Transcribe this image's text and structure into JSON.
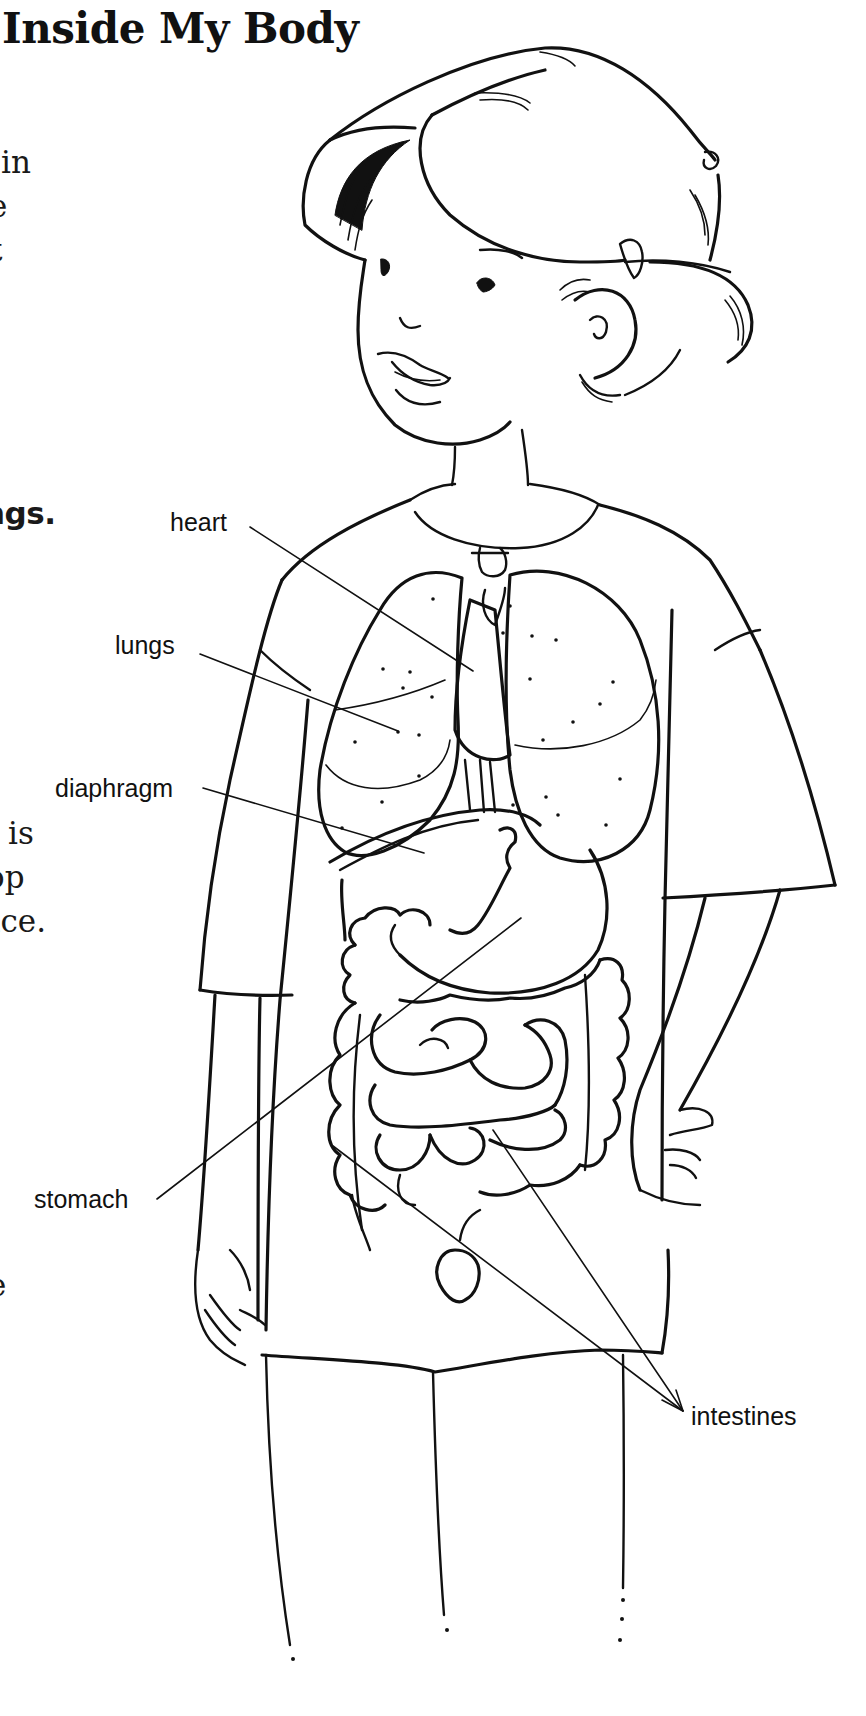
{
  "page": {
    "title": "Inside My Body",
    "background": "#ffffff",
    "ink_color": "#111111"
  },
  "body_text_fragments": [
    {
      "id": "line-1",
      "text": "in"
    },
    {
      "id": "line-2",
      "text": "e"
    },
    {
      "id": "line-3",
      "text": "t"
    },
    {
      "id": "line-4",
      "text": "t."
    },
    {
      "id": "line-5",
      "text": "ngs.",
      "emphasis": "bold"
    },
    {
      "id": "line-6",
      "text": "is"
    },
    {
      "id": "line-7",
      "text": "op"
    },
    {
      "id": "line-8",
      "text": "ace."
    },
    {
      "id": "line-9",
      "text": "e"
    }
  ],
  "illustration": {
    "subject": "child with labeled internal organs",
    "labels": {
      "heart": "heart",
      "lungs": "lungs",
      "diaphragm": "diaphragm",
      "stomach": "stomach",
      "intestines": "intestines"
    }
  }
}
